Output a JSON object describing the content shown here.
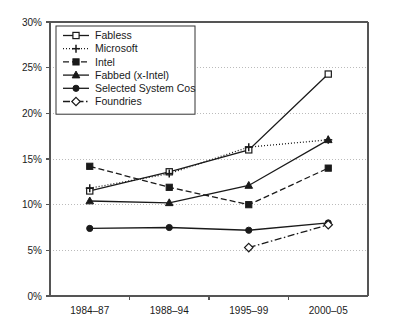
{
  "chart_data": {
    "type": "line",
    "title": "",
    "xlabel": "",
    "ylabel": "",
    "categories": [
      "1984–87",
      "1988–94",
      "1995–99",
      "2000–05"
    ],
    "ylim": [
      0,
      30
    ],
    "ytick_labels": [
      "0%",
      "5%",
      "10%",
      "15%",
      "20%",
      "25%",
      "30%"
    ],
    "ytick_values": [
      0,
      5,
      10,
      15,
      20,
      25,
      30
    ],
    "grid": true,
    "legend_position": "top-left",
    "series": [
      {
        "name": "Fabless",
        "values": [
          11.5,
          13.6,
          16.0,
          24.3
        ],
        "marker": "open-square",
        "line_style": "solid",
        "color": "#1a1a1a"
      },
      {
        "name": "Microsoft",
        "values": [
          11.8,
          13.4,
          16.3,
          17.1
        ],
        "marker": "plus",
        "line_style": "dotted",
        "color": "#1a1a1a"
      },
      {
        "name": "Intel",
        "values": [
          14.2,
          11.9,
          10.0,
          14.0
        ],
        "marker": "filled-square",
        "line_style": "dashed",
        "color": "#1a1a1a"
      },
      {
        "name": "Fabbed (x-Intel)",
        "values": [
          10.4,
          10.2,
          12.1,
          17.1
        ],
        "marker": "filled-triangle",
        "line_style": "solid",
        "color": "#1a1a1a"
      },
      {
        "name": "Selected System Cos",
        "values": [
          7.4,
          7.5,
          7.2,
          8.0
        ],
        "marker": "filled-circle",
        "line_style": "solid",
        "color": "#1a1a1a"
      },
      {
        "name": "Foundries",
        "values": [
          null,
          null,
          5.3,
          7.8
        ],
        "marker": "open-diamond",
        "line_style": "dash-dot",
        "color": "#1a1a1a"
      }
    ]
  },
  "legend": {
    "items": [
      {
        "label": "Fabless"
      },
      {
        "label": "Microsoft"
      },
      {
        "label": "Intel"
      },
      {
        "label": "Fabbed (x-Intel)"
      },
      {
        "label": "Selected System Cos"
      },
      {
        "label": "Foundries"
      }
    ]
  }
}
